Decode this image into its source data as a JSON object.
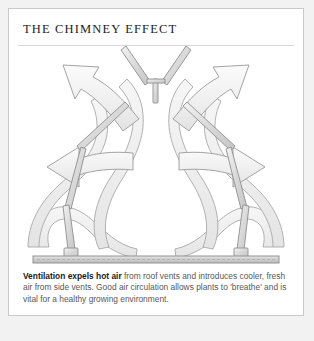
{
  "card": {
    "title": "THE CHIMNEY EFFECT",
    "caption": {
      "lead": "Ventilation expels hot air",
      "rest": " from roof vents and introduces cooler, fresh air from side vents. Good air circulation allows plants to 'breathe' and is vital for a healthy growing environment."
    }
  },
  "diagram": {
    "name": "chimney-effect-airflow-diagram",
    "colors": {
      "page_background": "#f2f2f2",
      "card_background": "#ffffff",
      "card_border": "#c9c9c9",
      "arrow_fill": "#efefef",
      "arrow_stroke": "#9a9a9a",
      "ribbon_fill": "#f1f1f1",
      "ribbon_stroke": "#a8a8a8",
      "structure_fill": "#e2e2e2",
      "structure_stroke": "#8e8e8e",
      "ground_fill": "#d5d5d5",
      "ground_stroke": "#8a8a8a",
      "title_color": "#1d1d1d",
      "caption_color": "#585858"
    },
    "parts": [
      {
        "id": "roof-vent-left-flap",
        "label": "Roof vent flap (left)"
      },
      {
        "id": "roof-vent-right-flap",
        "label": "Roof vent flap (right)"
      },
      {
        "id": "roof-vent-post",
        "label": "Roof vent centre post"
      },
      {
        "id": "side-vent-left-panel",
        "label": "Side vent panel (left)"
      },
      {
        "id": "side-vent-right-panel",
        "label": "Side vent panel (right)"
      },
      {
        "id": "side-vent-left-strut",
        "label": "Side vent strut (left)"
      },
      {
        "id": "side-vent-right-strut",
        "label": "Side vent strut (right)"
      },
      {
        "id": "ground-bar",
        "label": "Ground bar"
      },
      {
        "id": "ground-post-left",
        "label": "Ground post (left)"
      },
      {
        "id": "ground-post-right",
        "label": "Ground post (right)"
      }
    ],
    "flows": [
      {
        "id": "exhaust-arrow-outer-left",
        "direction": "up-left",
        "label": "Hot air expelled upper left"
      },
      {
        "id": "exhaust-arrow-inner-left",
        "direction": "up-left",
        "label": "Hot air expelled inner left"
      },
      {
        "id": "exhaust-arrow-inner-right",
        "direction": "up-right",
        "label": "Hot air expelled inner right"
      },
      {
        "id": "exhaust-arrow-outer-right",
        "direction": "up-right",
        "label": "Hot air expelled outer right"
      },
      {
        "id": "intake-ribbon-left",
        "direction": "inward-and-up",
        "label": "Cool air drawn in from left side vent"
      },
      {
        "id": "intake-ribbon-right",
        "direction": "inward-and-up",
        "label": "Cool air drawn in from right side vent"
      },
      {
        "id": "central-column-left",
        "direction": "rising",
        "label": "Warm air rising in centre (left ribbon)"
      },
      {
        "id": "central-column-right",
        "direction": "rising",
        "label": "Warm air rising in centre (right ribbon)"
      }
    ]
  }
}
